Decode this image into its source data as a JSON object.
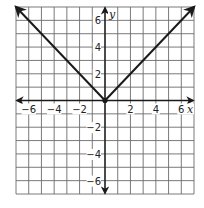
{
  "chart_data": {
    "type": "line",
    "title": "",
    "function": "y = |x|",
    "xlabel": "x",
    "ylabel": "y",
    "xlim": [
      -7,
      7
    ],
    "ylim": [
      -7,
      7
    ],
    "grid": true,
    "grid_step": 1,
    "x_ticks": [
      -6,
      -4,
      -2,
      2,
      4,
      6
    ],
    "y_ticks": [
      -6,
      -4,
      -2,
      2,
      4,
      6
    ],
    "x_tick_labels": [
      "−6",
      "−4",
      "−2",
      "2",
      "4",
      "6"
    ],
    "y_tick_labels": [
      "−6",
      "−4",
      "−2",
      "2",
      "4",
      "6"
    ],
    "series": [
      {
        "name": "absolute value graph",
        "points": [
          [
            -7,
            7
          ],
          [
            0,
            0
          ],
          [
            7,
            7
          ]
        ],
        "vertex": [
          0,
          0
        ],
        "arrows_at_ends": true
      }
    ],
    "colors": {
      "curve": "#1a1a1a",
      "grid": "#6b6b6b",
      "axis": "#1a1a1a",
      "background": "#ffffff"
    }
  }
}
